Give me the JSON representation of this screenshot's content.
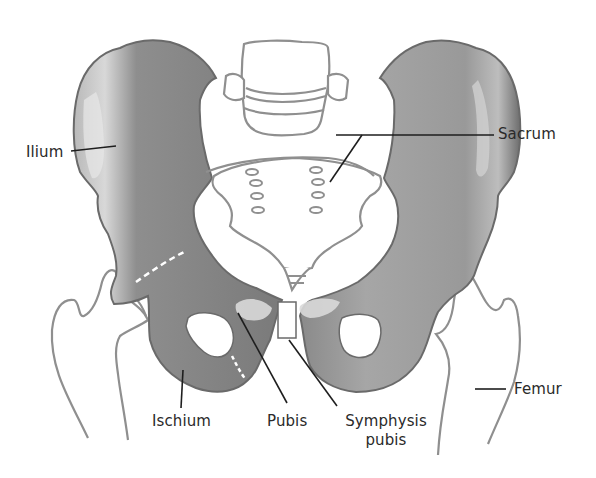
{
  "figure": {
    "colors": {
      "bone_fill": "#8c8c8c",
      "bone_dark": "#6e6e6e",
      "bone_light": "#c8c8c8",
      "outline": "#8a8a8a",
      "leader": "#1e1e1e",
      "text": "#2a2a2a",
      "background": "#ffffff"
    }
  },
  "labels": {
    "ilium": "Ilium",
    "sacrum": "Sacrum",
    "ischium": "Ischium",
    "pubis": "Pubis",
    "symphysis_line1": "Symphysis",
    "symphysis_line2": "pubis",
    "femur": "Femur"
  }
}
